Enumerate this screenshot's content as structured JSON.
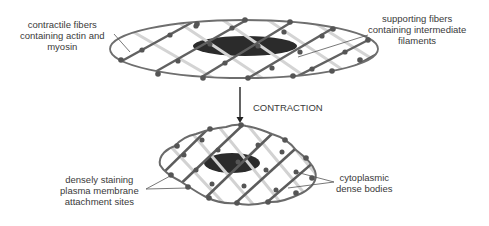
{
  "diagram": {
    "stages": [
      {
        "name": "relaxed",
        "shape": "elongated ellipse"
      },
      {
        "name": "contracted",
        "shape": "compact rounded cell"
      }
    ],
    "arrow_label": "CONTRACTION",
    "labels": {
      "contractile_fibers": [
        "contractile fibers",
        "containing actin and",
        "myosin"
      ],
      "supporting_fibers": [
        "supporting fibers",
        "containing intermediate",
        "filaments"
      ],
      "attachment_sites": [
        "densely staining",
        "plasma membrane",
        "attachment sites"
      ],
      "dense_bodies": [
        "cytoplasmic",
        "dense bodies"
      ]
    },
    "colors": {
      "membrane": "#6e6e6e",
      "contractile_fiber": "#5f5f5f",
      "supporting_fiber": "#cfcfcf",
      "dense_body": "#555555",
      "nucleus": "#2b2b2b",
      "text": "#3a3a3a"
    }
  }
}
